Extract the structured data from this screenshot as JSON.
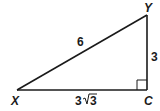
{
  "diagram": {
    "type": "right-triangle",
    "vertices": {
      "X": {
        "label": "X",
        "x": 17,
        "y": 90
      },
      "Y": {
        "label": "Y",
        "x": 147,
        "y": 15
      },
      "C": {
        "label": "C",
        "x": 147,
        "y": 90
      }
    },
    "sides": {
      "XY": {
        "label": "6"
      },
      "YC": {
        "label": "3"
      },
      "XC": {
        "label": "3√3",
        "coefficient": "3",
        "radicand": "3"
      }
    },
    "right_angle_at": "C",
    "stroke_color": "#1a1a1a"
  }
}
